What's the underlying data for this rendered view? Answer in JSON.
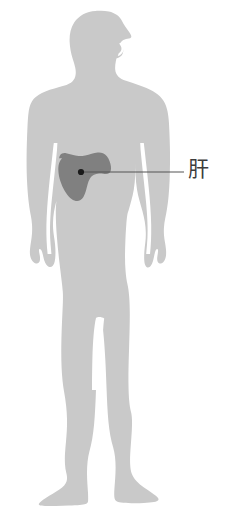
{
  "diagram": {
    "title": "",
    "type": "anatomical-body-silhouette",
    "background_color": "#ffffff",
    "body": {
      "name": "human-body-silhouette",
      "fill_color": "#c9c9c9",
      "orientation": "front-facing standing figure with head in right profile"
    },
    "organs": [
      {
        "id": "liver",
        "label": "肝",
        "fill_color": "#808080",
        "marker_color": "#1a1a1a",
        "leader_line_color": "#555555"
      }
    ],
    "label": {
      "text": "肝",
      "color": "#3d3d3d"
    }
  }
}
